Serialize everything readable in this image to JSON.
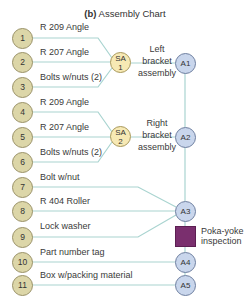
{
  "title": {
    "prefix": "(b)",
    "text": "Assembly Chart"
  },
  "parts": [
    {
      "num": "1",
      "label": "R 209 Angle"
    },
    {
      "num": "2",
      "label": "R 207 Angle"
    },
    {
      "num": "3",
      "label": "Bolts w/nuts (2)"
    },
    {
      "num": "4",
      "label": "R 209 Angle"
    },
    {
      "num": "5",
      "label": "R 207 Angle"
    },
    {
      "num": "6",
      "label": "Bolts w/nuts (2)"
    },
    {
      "num": "7",
      "label": "Bolt w/nut"
    },
    {
      "num": "8",
      "label": "R 404 Roller"
    },
    {
      "num": "9",
      "label": "Lock washer"
    },
    {
      "num": "10",
      "label": "Part number tag"
    },
    {
      "num": "11",
      "label": "Box w/packing material"
    }
  ],
  "subassemblies": [
    {
      "line1": "SA",
      "line2": "1",
      "desc": [
        "Left",
        "bracket",
        "assembly"
      ]
    },
    {
      "line1": "SA",
      "line2": "2",
      "desc": [
        "Right",
        "bracket",
        "assembly"
      ]
    }
  ],
  "assemblies": [
    "A1",
    "A2",
    "A3",
    "A4",
    "A5"
  ],
  "inspection": {
    "line1": "Poka-yoke",
    "line2": "inspection"
  },
  "colors": {
    "part_fill": "#dcd6a8",
    "sub_fill": "#f7e9b4",
    "asm_fill": "#c9d6ec",
    "line": "#a9d4d0",
    "inspection": "#7a2f6e"
  }
}
